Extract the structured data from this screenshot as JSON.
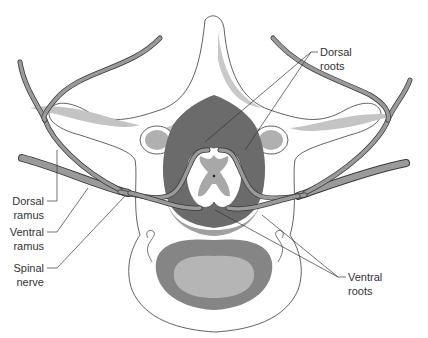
{
  "diagram": {
    "colors": {
      "bone": "#ffffff",
      "bone_outline": "#3a3a3a",
      "dura_dark": "#6b6b6b",
      "gray_matter": "#a8a8a8",
      "vertebral_body_outer": "#858585",
      "vertebral_body_inner": "#b5b5b5",
      "nerve": "#9a9a9a",
      "cartilage": "#c4c4c4"
    },
    "labels": {
      "dorsal_roots": [
        "Dorsal",
        "roots"
      ],
      "ventral_roots": [
        "Ventral",
        "roots"
      ],
      "dorsal_ramus": [
        "Dorsal",
        "ramus"
      ],
      "ventral_ramus": [
        "Ventral",
        "ramus"
      ],
      "spinal_nerve": [
        "Spinal",
        "nerve"
      ]
    }
  }
}
